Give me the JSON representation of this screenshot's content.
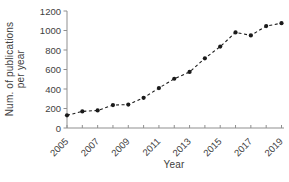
{
  "chart_data": {
    "type": "line",
    "title": "",
    "xlabel": "Year",
    "ylabel": "Num. of publications per year",
    "ylabel_lines": [
      "Num. of publications",
      "per year"
    ],
    "x": [
      2005,
      2006,
      2007,
      2008,
      2009,
      2010,
      2011,
      2012,
      2013,
      2014,
      2015,
      2016,
      2017,
      2018,
      2019
    ],
    "series": [
      {
        "name": "publications-per-year",
        "values": [
          130,
          170,
          180,
          235,
          240,
          310,
          410,
          505,
          575,
          715,
          835,
          980,
          950,
          1045,
          1075
        ]
      }
    ],
    "xlim": [
      2005,
      2019
    ],
    "ylim": [
      0,
      1200
    ],
    "y_ticks": [
      0,
      200,
      400,
      600,
      800,
      1000,
      1200
    ],
    "x_ticks": [
      2005,
      2006,
      2007,
      2008,
      2009,
      2010,
      2011,
      2012,
      2013,
      2014,
      2015,
      2016,
      2017,
      2018,
      2019
    ],
    "x_tick_labels": [
      "2005",
      "2007",
      "2009",
      "2011",
      "2013",
      "2015",
      "2017",
      "2019"
    ],
    "x_tick_label_rotation": -45,
    "grid": false,
    "legend": "none",
    "line_style": "dashed",
    "marker": "filled-circle",
    "colors": {
      "line": "#1a1a1a",
      "marker": "#1a1a1a",
      "axis": "#8f8f8f",
      "text": "#3e3e3e",
      "background": "#ffffff"
    }
  }
}
